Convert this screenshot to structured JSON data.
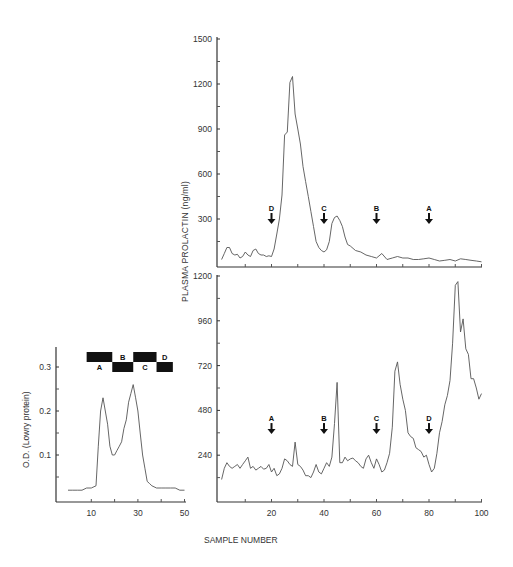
{
  "figure": {
    "xlabel_shared": "SAMPLE NUMBER",
    "ylabel_right": "PLASMA PROLACTIN (ng/ml)",
    "ylabel_left": "O.D. (Lowry protein)"
  },
  "chart_data": [
    {
      "id": "top",
      "type": "line",
      "title": "",
      "xlabel": "SAMPLE NUMBER",
      "ylabel": "PLASMA PROLACTIN (ng/ml)",
      "ylim": [
        0,
        1500
      ],
      "xlim": [
        0,
        100
      ],
      "yticks": [
        300,
        600,
        900,
        1200,
        1500
      ],
      "x": [
        1,
        2,
        3,
        4,
        5,
        6,
        7,
        8,
        9,
        10,
        11,
        12,
        13,
        14,
        15,
        16,
        17,
        18,
        19,
        20,
        21,
        22,
        23,
        24,
        25,
        26,
        27,
        28,
        29,
        30,
        31,
        32,
        33,
        34,
        35,
        36,
        37,
        38,
        39,
        40,
        41,
        42,
        43,
        44,
        45,
        46,
        47,
        48,
        49,
        50,
        52,
        54,
        56,
        58,
        60,
        62,
        64,
        66,
        68,
        70,
        72,
        74,
        76,
        78,
        80,
        82,
        84,
        86,
        88,
        90,
        92,
        94,
        96,
        98,
        100
      ],
      "values": [
        30,
        70,
        110,
        110,
        70,
        60,
        65,
        40,
        50,
        80,
        60,
        50,
        90,
        100,
        70,
        60,
        60,
        50,
        55,
        50,
        100,
        200,
        300,
        460,
        860,
        880,
        1210,
        1250,
        1000,
        900,
        800,
        650,
        550,
        450,
        350,
        250,
        150,
        110,
        90,
        80,
        95,
        150,
        270,
        310,
        320,
        290,
        250,
        180,
        130,
        120,
        90,
        80,
        60,
        50,
        40,
        70,
        30,
        40,
        50,
        40,
        40,
        30,
        30,
        35,
        40,
        30,
        20,
        25,
        30,
        20,
        35,
        30,
        25,
        20,
        15
      ],
      "annotations": [
        {
          "label": "D",
          "x": 20,
          "y": 300
        },
        {
          "label": "C",
          "x": 40,
          "y": 300
        },
        {
          "label": "B",
          "x": 60,
          "y": 300
        },
        {
          "label": "A",
          "x": 80,
          "y": 300
        }
      ]
    },
    {
      "id": "bottom",
      "type": "line",
      "title": "",
      "xlabel": "SAMPLE NUMBER",
      "ylabel": "PLASMA PROLACTIN (ng/ml)",
      "ylim": [
        0,
        1200
      ],
      "xlim": [
        0,
        100
      ],
      "xticks": [
        20,
        40,
        60,
        80,
        100
      ],
      "yticks": [
        240,
        480,
        720,
        960,
        1200
      ],
      "x": [
        1,
        2,
        3,
        4,
        5,
        6,
        7,
        8,
        9,
        10,
        11,
        12,
        13,
        14,
        15,
        16,
        17,
        18,
        19,
        20,
        21,
        22,
        23,
        24,
        25,
        26,
        27,
        28,
        29,
        30,
        31,
        32,
        33,
        34,
        35,
        36,
        37,
        38,
        39,
        40,
        41,
        42,
        43,
        44,
        45,
        46,
        47,
        48,
        49,
        50,
        51,
        52,
        53,
        54,
        55,
        56,
        57,
        58,
        59,
        60,
        61,
        62,
        63,
        64,
        65,
        66,
        67,
        68,
        69,
        70,
        71,
        72,
        73,
        74,
        75,
        76,
        77,
        78,
        79,
        80,
        81,
        82,
        83,
        84,
        85,
        86,
        87,
        88,
        89,
        90,
        91,
        92,
        93,
        94,
        95,
        96,
        97,
        98,
        99,
        100
      ],
      "values": [
        110,
        170,
        200,
        180,
        170,
        180,
        190,
        170,
        190,
        210,
        230,
        170,
        180,
        160,
        170,
        180,
        165,
        170,
        190,
        150,
        170,
        130,
        140,
        170,
        220,
        210,
        190,
        180,
        310,
        190,
        180,
        160,
        130,
        130,
        120,
        150,
        190,
        150,
        140,
        170,
        200,
        180,
        230,
        410,
        630,
        200,
        200,
        230,
        210,
        220,
        225,
        210,
        200,
        180,
        170,
        220,
        240,
        200,
        170,
        220,
        190,
        150,
        160,
        200,
        250,
        390,
        690,
        740,
        620,
        540,
        480,
        360,
        340,
        330,
        280,
        270,
        260,
        230,
        240,
        190,
        150,
        170,
        250,
        360,
        420,
        510,
        560,
        640,
        840,
        1150,
        1170,
        900,
        970,
        810,
        780,
        650,
        650,
        600,
        540,
        570
      ],
      "annotations": [
        {
          "label": "A",
          "x": 20,
          "y": 380
        },
        {
          "label": "B",
          "x": 40,
          "y": 380
        },
        {
          "label": "C",
          "x": 60,
          "y": 380
        },
        {
          "label": "D",
          "x": 80,
          "y": 380
        }
      ]
    },
    {
      "id": "left",
      "type": "line",
      "title": "",
      "xlabel": "",
      "ylabel": "O.D. (Lowry protein)",
      "ylim": [
        0,
        0.32
      ],
      "xlim": [
        0,
        50
      ],
      "xticks": [
        10,
        30,
        50
      ],
      "yticks": [
        0.1,
        0.2,
        0.3
      ],
      "x": [
        0,
        2,
        4,
        6,
        8,
        10,
        12,
        13,
        14,
        15,
        16,
        17,
        18,
        19,
        20,
        21,
        22,
        23,
        24,
        25,
        26,
        27,
        28,
        29,
        30,
        31,
        32,
        33,
        34,
        35,
        36,
        38,
        40,
        42,
        44,
        46,
        48,
        50
      ],
      "values": [
        0.02,
        0.02,
        0.02,
        0.02,
        0.025,
        0.025,
        0.03,
        0.12,
        0.2,
        0.23,
        0.2,
        0.17,
        0.12,
        0.1,
        0.1,
        0.11,
        0.12,
        0.13,
        0.16,
        0.18,
        0.22,
        0.24,
        0.26,
        0.23,
        0.2,
        0.15,
        0.1,
        0.07,
        0.04,
        0.035,
        0.03,
        0.025,
        0.025,
        0.025,
        0.025,
        0.025,
        0.02,
        0.02
      ],
      "fraction_bars": [
        {
          "label": "A",
          "x0": 8,
          "x1": 19,
          "row": "top",
          "label_pos": "below"
        },
        {
          "label": "B",
          "x0": 19,
          "x1": 28,
          "row": "bottom",
          "label_pos": "above"
        },
        {
          "label": "C",
          "x0": 28,
          "x1": 38,
          "row": "top",
          "label_pos": "below"
        },
        {
          "label": "D",
          "x0": 38,
          "x1": 45,
          "row": "bottom",
          "label_pos": "above"
        }
      ]
    }
  ]
}
